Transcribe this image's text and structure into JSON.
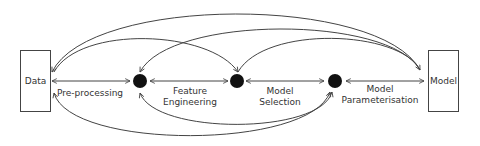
{
  "diagram": {
    "nodes": [
      {
        "id": "data",
        "label": "Data",
        "type": "box"
      },
      {
        "id": "n1",
        "type": "dot"
      },
      {
        "id": "n2",
        "type": "dot"
      },
      {
        "id": "n3",
        "type": "dot"
      },
      {
        "id": "model",
        "label": "Model",
        "type": "box"
      }
    ],
    "edges": [
      {
        "from": "data",
        "to": "n1",
        "label_line1": "Pre-processing",
        "label_line2": "",
        "bidirectional": true
      },
      {
        "from": "n1",
        "to": "n2",
        "label_line1": "Feature",
        "label_line2": "Engineering",
        "bidirectional": true
      },
      {
        "from": "n2",
        "to": "n3",
        "label_line1": "Model",
        "label_line2": "Selection",
        "bidirectional": true
      },
      {
        "from": "n3",
        "to": "model",
        "label_line1": "Model",
        "label_line2": "Parameterisation",
        "bidirectional": true
      }
    ],
    "colors": {
      "line": "#444444",
      "dot": "#111111",
      "text": "#333333"
    }
  }
}
